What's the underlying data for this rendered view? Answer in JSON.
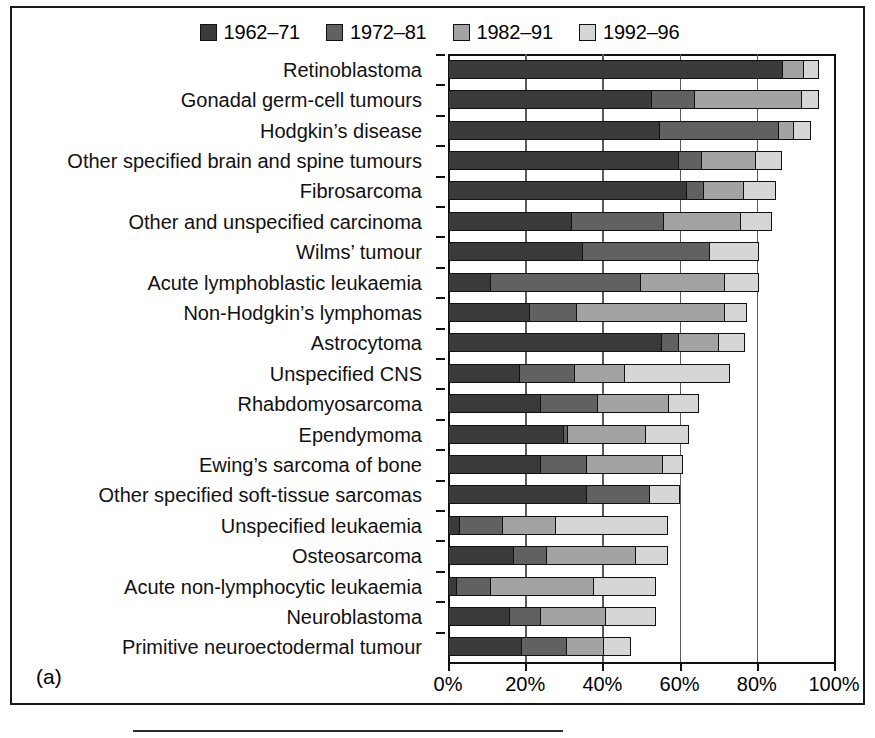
{
  "figure": {
    "panel_label": "(a)"
  },
  "legend": {
    "position": "top-center",
    "items": [
      {
        "label": "1962–71",
        "color": "#3a3a3a",
        "icon": "legend-swatch-icon"
      },
      {
        "label": "1972–81",
        "color": "#616161",
        "icon": "legend-swatch-icon"
      },
      {
        "label": "1982–91",
        "color": "#a3a3a3",
        "icon": "legend-swatch-icon"
      },
      {
        "label": "1992–96",
        "color": "#d6d6d6",
        "icon": "legend-swatch-icon"
      }
    ]
  },
  "axis": {
    "x_ticks": [
      "0%",
      "20%",
      "40%",
      "60%",
      "80%",
      "100%"
    ],
    "x_tick_values": [
      0,
      20,
      40,
      60,
      80,
      100
    ]
  },
  "chart_data": {
    "type": "bar",
    "orientation": "horizontal",
    "stacked": true,
    "title": "",
    "subtitle": "",
    "xlabel": "",
    "ylabel": "",
    "xlim": [
      0,
      100
    ],
    "x_unit": "percent",
    "grid": "vertical",
    "legend_position": "top-center",
    "annotations": [
      "(a)"
    ],
    "series": [
      {
        "name": "1962–71",
        "color": "#3a3a3a",
        "values": [
          87,
          53,
          55,
          60,
          62,
          32,
          35,
          11,
          21,
          55.5,
          18.5,
          24,
          30,
          24,
          36,
          3,
          17,
          2,
          16,
          19
        ]
      },
      {
        "name": "1972–81",
        "color": "#616161",
        "values": [
          0,
          11,
          31,
          6,
          4.5,
          24,
          33,
          39,
          12.5,
          4.5,
          14.5,
          15,
          1,
          12,
          16.5,
          11,
          8.5,
          9,
          8,
          12
        ]
      },
      {
        "name": "1982–91",
        "color": "#a3a3a3",
        "values": [
          5.5,
          28,
          4,
          14,
          10.5,
          20,
          0,
          22,
          38.5,
          10.5,
          13,
          18.5,
          20.5,
          20,
          0,
          14,
          23.5,
          27,
          17,
          9.5
        ]
      },
      {
        "name": "1992–96",
        "color": "#d6d6d6",
        "values": [
          3.5,
          4,
          4,
          6.5,
          8,
          8,
          12.5,
          8.5,
          5.5,
          6.5,
          27,
          7.5,
          11,
          5,
          7.5,
          29,
          8,
          16,
          13,
          7
        ]
      }
    ],
    "categories": [
      "Retinoblastoma",
      "Gonadal germ-cell tumours",
      "Hodgkin’s disease",
      "Other specified brain and spine tumours",
      "Fibrosarcoma",
      "Other and unspecified carcinoma",
      "Wilms’ tumour",
      "Acute lymphoblastic leukaemia",
      "Non-Hodgkin’s lymphomas",
      "Astrocytoma",
      "Unspecified CNS",
      "Rhabdomyosarcoma",
      "Ependymoma",
      "Ewing’s sarcoma of bone",
      "Other specified soft-tissue sarcomas",
      "Unspecified leukaemia",
      "Osteosarcoma",
      "Acute non-lymphocytic leukaemia",
      "Neuroblastoma",
      "Primitive neuroectodermal tumour"
    ],
    "totals": [
      96,
      96,
      94,
      86.5,
      85,
      84,
      80.5,
      80.5,
      77.5,
      77,
      73,
      65,
      62.5,
      61,
      60,
      57,
      57,
      54,
      54,
      47.5
    ]
  }
}
